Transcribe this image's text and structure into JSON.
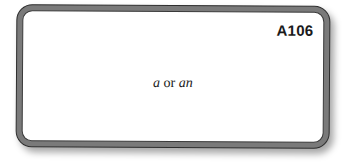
{
  "card": {
    "code": "A106",
    "text": {
      "word1": "a",
      "connector": " or ",
      "word2": "an"
    },
    "colors": {
      "border": "#7a7a7a",
      "outline": "#2e2e2e",
      "background": "#ffffff",
      "text": "#1a1a1a"
    }
  }
}
